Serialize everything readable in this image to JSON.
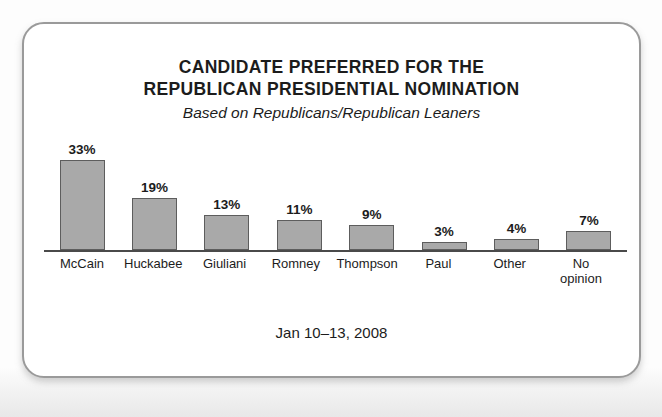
{
  "card": {
    "border_color": "#9a9a9a",
    "background": "#ffffff"
  },
  "chart_data": {
    "type": "bar",
    "title": "CANDIDATE PREFERRED FOR THE REPUBLICAN PRESIDENTIAL NOMINATION",
    "title_lines": [
      "CANDIDATE PREFERRED FOR THE",
      "REPUBLICAN PRESIDENTIAL NOMINATION"
    ],
    "subtitle": "Based on Republicans/Republican Leaners",
    "footnote": "Jan 10–13, 2008",
    "categories": [
      "McCain",
      "Huckabee",
      "Giuliani",
      "Romney",
      "Thompson",
      "Paul",
      "Other",
      "No opinion"
    ],
    "category_lines": [
      [
        "McCain"
      ],
      [
        "Huckabee"
      ],
      [
        "Giuliani"
      ],
      [
        "Romney"
      ],
      [
        "Thompson"
      ],
      [
        "Paul"
      ],
      [
        "Other"
      ],
      [
        "No",
        "opinion"
      ]
    ],
    "values": [
      33,
      19,
      13,
      11,
      9,
      3,
      4,
      7
    ],
    "value_labels": [
      "33%",
      "19%",
      "13%",
      "11%",
      "9%",
      "3%",
      "4%",
      "7%"
    ],
    "xlabel": "",
    "ylabel": "",
    "ylim": [
      0,
      33
    ],
    "grid": false,
    "legend": false,
    "bar_fill": "#a9a9a9",
    "bar_stroke": "#5d5d5d",
    "axis_color": "#4a4a4a",
    "text_color": "#1c1c1c"
  }
}
